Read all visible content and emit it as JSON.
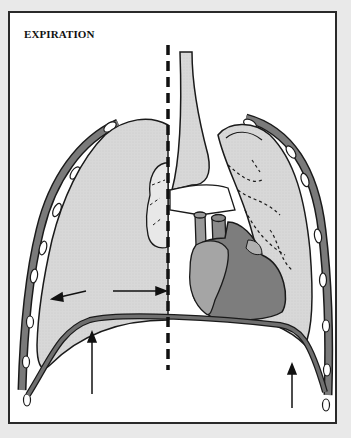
{
  "figure": {
    "title": "EXPIRATION",
    "colors": {
      "background": "#e9e9e9",
      "frame_fill": "#ffffff",
      "frame_border": "#2a2a2a",
      "lung_fill": "#d8d8d8",
      "heart_light": "#9a9a9a",
      "heart_dark": "#7d7d7d",
      "diaphragm": "#6f6f6f",
      "outline": "#1a1a1a"
    },
    "elements": [
      {
        "name": "right-lung",
        "label": "right lung (deflated)"
      },
      {
        "name": "left-lung",
        "label": "left lung"
      },
      {
        "name": "trachea",
        "label": "trachea"
      },
      {
        "name": "heart",
        "label": "heart"
      },
      {
        "name": "diaphragm",
        "label": "diaphragm (relaxed, domed upward)"
      },
      {
        "name": "ribcage",
        "label": "ribs / intercostal muscles"
      },
      {
        "name": "midline",
        "label": "dashed midline"
      }
    ],
    "arrows": [
      {
        "name": "inward-arrow-left",
        "direction": "left"
      },
      {
        "name": "inward-arrow-right",
        "direction": "right"
      },
      {
        "name": "diaphragm-up-arrow-left",
        "direction": "up"
      },
      {
        "name": "diaphragm-up-arrow-right",
        "direction": "up"
      }
    ]
  }
}
